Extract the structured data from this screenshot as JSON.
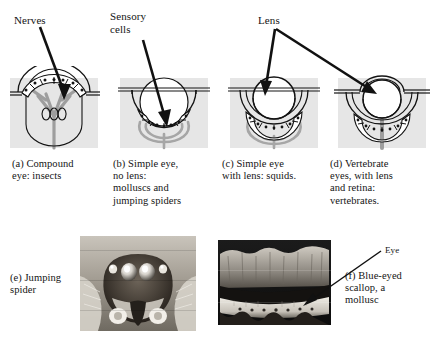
{
  "figure": {
    "background_color": "#ffffff",
    "panel_fill": "#e6e6e6",
    "line_color": "#141414",
    "nerve_color": "#9a9a9a"
  },
  "callouts": [
    {
      "id": "nerves",
      "label": "Nerves",
      "x": 14,
      "y": 14
    },
    {
      "id": "sensory_cells",
      "label": "Sensory\ncells",
      "x": 110,
      "y": 10
    },
    {
      "id": "lens",
      "label": "Lens",
      "x": 258,
      "y": 14
    },
    {
      "id": "eye",
      "label": "Eye",
      "x": 385,
      "y": 246
    }
  ],
  "panels": [
    {
      "key": "a",
      "caption": "(a) Compound\neye: insects",
      "caption_x": 12,
      "caption_y": 158,
      "diagram_x": 2,
      "type": "compound",
      "has_lens": false,
      "has_retina": false
    },
    {
      "key": "b",
      "caption": "(b) Simple eye,\nno lens:\nmolluscs and\njumping spiders",
      "caption_x": 113,
      "caption_y": 158,
      "diagram_x": 112,
      "type": "simple-no-lens",
      "has_lens": false,
      "has_retina": false
    },
    {
      "key": "c",
      "caption": "(c) Simple eye\nwith lens: squids.",
      "caption_x": 222,
      "caption_y": 158,
      "diagram_x": 222,
      "type": "simple-with-lens",
      "has_lens": true,
      "has_retina": false
    },
    {
      "key": "d",
      "caption": "(d)  Vertebrate\neyes, with lens\nand retina:\nvertebrates.",
      "caption_x": 330,
      "caption_y": 158,
      "diagram_x": 330,
      "type": "vertebrate",
      "has_lens": true,
      "has_retina": true
    }
  ],
  "photos": [
    {
      "key": "e",
      "caption": "(e) Jumping\nspider",
      "caption_x": 10,
      "caption_y": 272,
      "subject": "jumping-spider-face",
      "x": 80,
      "y": 236,
      "width": 116,
      "height": 95
    },
    {
      "key": "f",
      "caption": "(f) Blue-eyed\nscallop, a\nmollusc",
      "caption_x": 345,
      "caption_y": 272,
      "subject": "blue-eyed-scallop-mantle",
      "x": 218,
      "y": 240,
      "width": 113,
      "height": 85
    }
  ],
  "arrows": [
    {
      "id": "nerves-to-a",
      "from_x": 40,
      "from_y": 26,
      "to_x": 64,
      "to_y": 96
    },
    {
      "id": "sensory-to-b",
      "from_x": 143,
      "from_y": 38,
      "to_x": 166,
      "to_y": 122
    },
    {
      "id": "lens-to-c",
      "from_x": 272,
      "from_y": 30,
      "to_x": 266,
      "to_y": 92
    },
    {
      "id": "lens-to-d",
      "from_x": 276,
      "from_y": 30,
      "to_x": 371,
      "to_y": 92
    },
    {
      "id": "eye-to-scallop",
      "from_x": 382,
      "from_y": 250,
      "to_x": 305,
      "to_y": 305
    }
  ]
}
